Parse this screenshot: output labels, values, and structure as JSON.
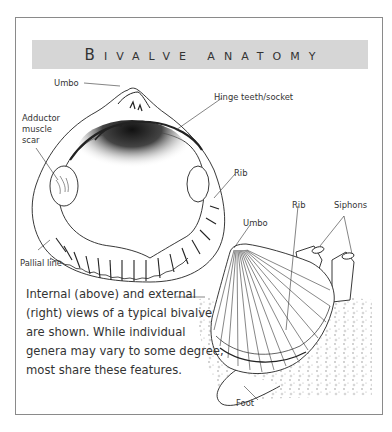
{
  "figure": {
    "title_first_letter": "B",
    "title_rest": "IVALVE ANATOMY",
    "title_full": "Bivalve anatomy",
    "banner_color": "#d6d6d6",
    "border_color": "#8a8a8a"
  },
  "internal_view": {
    "labels": {
      "umbo": "Umbo",
      "hinge": "Hinge teeth/socket",
      "adductor_line1": "Adductor",
      "adductor_line2": "muscle",
      "adductor_line3": "scar",
      "rib": "Rib",
      "pallial": "Pallial line"
    }
  },
  "external_view": {
    "labels": {
      "umbo": "Umbo",
      "rib": "Rib",
      "siphons": "Siphons",
      "foot": "Foot"
    }
  },
  "caption": "Internal (above) and external (right) views of a typical bivalve are shown. While individual genera may vary to some degree, most share these features."
}
